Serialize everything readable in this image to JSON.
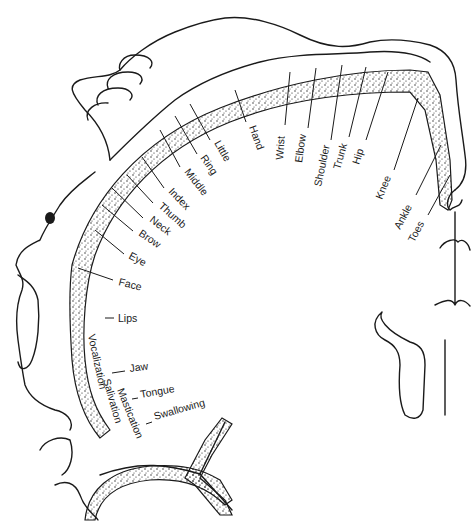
{
  "diagram": {
    "stroke_color": "#1a1a1a",
    "background": "#ffffff",
    "labels": [
      {
        "id": "toes",
        "text": "Toes",
        "x": 414,
        "y": 243,
        "rot": -62,
        "lx1": 428,
        "ly1": 215,
        "lx2": 450,
        "ly2": 175
      },
      {
        "id": "ankle",
        "text": "Ankle",
        "x": 400,
        "y": 230,
        "rot": -62,
        "lx1": 416,
        "ly1": 195,
        "lx2": 441,
        "ly2": 145
      },
      {
        "id": "knee",
        "text": "Knee",
        "x": 382,
        "y": 200,
        "rot": -68,
        "lx1": 394,
        "ly1": 170,
        "lx2": 418,
        "ly2": 98
      },
      {
        "id": "hip",
        "text": "Hip",
        "x": 359,
        "y": 165,
        "rot": -72,
        "lx1": 366,
        "ly1": 140,
        "lx2": 388,
        "ly2": 72
      },
      {
        "id": "trunk",
        "text": "Trunk",
        "x": 340,
        "y": 170,
        "rot": -74,
        "lx1": 349,
        "ly1": 137,
        "lx2": 366,
        "ly2": 67
      },
      {
        "id": "shoulder",
        "text": "Shoulder",
        "x": 321,
        "y": 187,
        "rot": -78,
        "lx1": 331,
        "ly1": 140,
        "lx2": 342,
        "ly2": 65
      },
      {
        "id": "elbow",
        "text": "Elbow",
        "x": 302,
        "y": 163,
        "rot": -82,
        "lx1": 308,
        "ly1": 128,
        "lx2": 316,
        "ly2": 68
      },
      {
        "id": "wrist",
        "text": "Wrist",
        "x": 283,
        "y": 160,
        "rot": -86,
        "lx1": 285,
        "ly1": 125,
        "lx2": 290,
        "ly2": 72
      },
      {
        "id": "hand",
        "text": "Hand",
        "x": 249,
        "y": 127,
        "rot": 70,
        "lx1": 246,
        "ly1": 122,
        "lx2": 235,
        "ly2": 90
      },
      {
        "id": "little",
        "text": "Little",
        "x": 214,
        "y": 143,
        "rot": 60,
        "lx1": 210,
        "ly1": 140,
        "lx2": 190,
        "ly2": 104
      },
      {
        "id": "ring",
        "text": "Ring",
        "x": 200,
        "y": 158,
        "rot": 55,
        "lx1": 197,
        "ly1": 154,
        "lx2": 175,
        "ly2": 116
      },
      {
        "id": "middle",
        "text": "Middle",
        "x": 184,
        "y": 172,
        "rot": 52,
        "lx1": 180,
        "ly1": 167,
        "lx2": 160,
        "ly2": 130
      },
      {
        "id": "index",
        "text": "Index",
        "x": 168,
        "y": 192,
        "rot": 46,
        "lx1": 164,
        "ly1": 188,
        "lx2": 142,
        "ly2": 157
      },
      {
        "id": "thumb",
        "text": "Thumb",
        "x": 158,
        "y": 207,
        "rot": 42,
        "lx1": 153,
        "ly1": 203,
        "lx2": 127,
        "ly2": 175
      },
      {
        "id": "neck",
        "text": "Neck",
        "x": 149,
        "y": 221,
        "rot": 38,
        "lx1": 143,
        "ly1": 218,
        "lx2": 112,
        "ly2": 188
      },
      {
        "id": "brow",
        "text": "Brow",
        "x": 138,
        "y": 235,
        "rot": 34,
        "lx1": 133,
        "ly1": 231,
        "lx2": 102,
        "ly2": 205
      },
      {
        "id": "eye",
        "text": "Eye",
        "x": 128,
        "y": 258,
        "rot": 28,
        "lx1": 124,
        "ly1": 254,
        "lx2": 95,
        "ly2": 230
      },
      {
        "id": "face",
        "text": "Face",
        "x": 118,
        "y": 285,
        "rot": 14,
        "lx1": 113,
        "ly1": 280,
        "lx2": 78,
        "ly2": 268
      },
      {
        "id": "lips",
        "text": "Lips",
        "x": 118,
        "y": 322,
        "rot": 0,
        "lx1": 105,
        "ly1": 318,
        "lx2": 114,
        "ly2": 318
      },
      {
        "id": "jaw",
        "text": "Jaw",
        "x": 130,
        "y": 372,
        "rot": -8,
        "lx1": 112,
        "ly1": 373,
        "lx2": 125,
        "ly2": 371
      },
      {
        "id": "tongue",
        "text": "Tongue",
        "x": 141,
        "y": 398,
        "rot": -10,
        "lx1": 132,
        "ly1": 399,
        "lx2": 138,
        "ly2": 398
      },
      {
        "id": "swallowing",
        "text": "Swallowing",
        "x": 155,
        "y": 420,
        "rot": -16,
        "lx1": 146,
        "ly1": 424,
        "lx2": 152,
        "ly2": 422
      }
    ],
    "vertical_labels": [
      {
        "id": "vocalization",
        "text": "Vocalization",
        "x": 88,
        "y": 335,
        "rot": 78
      },
      {
        "id": "salivation",
        "text": "Salivation",
        "x": 103,
        "y": 380,
        "rot": 74
      },
      {
        "id": "mastication",
        "text": "Mastication",
        "x": 117,
        "y": 390,
        "rot": 68
      }
    ]
  }
}
